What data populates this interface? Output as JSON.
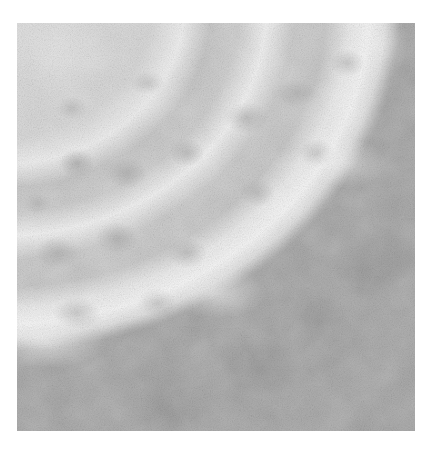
{
  "image": {
    "description": "Grayscale micrograph-like texture: large bright circular body with concentric mottled ridges in upper-left, darker gray background in lower-right",
    "palette": {
      "background_dark": "#a3a3a3",
      "disk_light": "#d9d9d9",
      "ridge_highlight": "#f1f1f1",
      "blotch_dark": "#969696",
      "page_background": "#ffffff"
    }
  }
}
